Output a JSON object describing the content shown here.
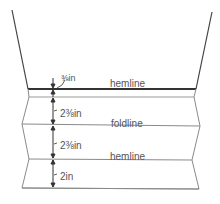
{
  "diagram": {
    "title": "",
    "labels": {
      "hemline_top": "hemline",
      "foldline": "foldline",
      "hemline_bottom": "hemline"
    },
    "measurements": {
      "m1": "⅜in",
      "m2": "2⅜in",
      "m3": "2⅜in",
      "m4": "2in"
    },
    "colors": {
      "line": "#8a8a8a",
      "hem": "#3a3a3a",
      "text": "#555555"
    }
  }
}
